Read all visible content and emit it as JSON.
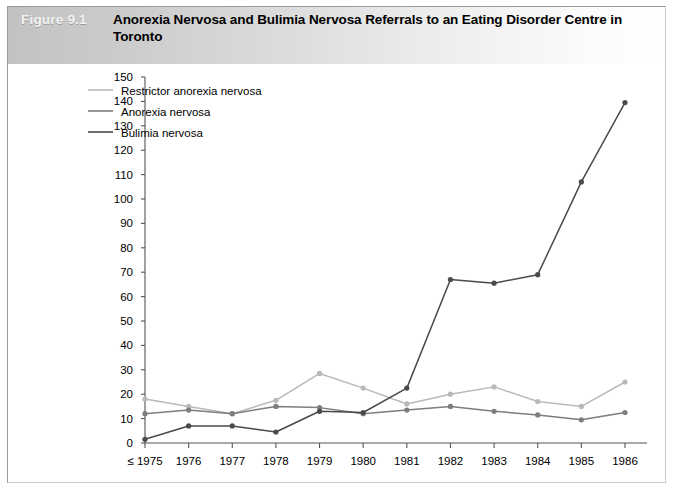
{
  "figure": {
    "number": "Figure 9.1",
    "title": "Anorexia Nervosa and Bulimia Nervosa Referrals to an Eating Disorder Centre in Toronto"
  },
  "colors": {
    "series_light": "#b9b9b9",
    "series_medium": "#7d7d7d",
    "series_dark": "#4a4a4a",
    "axis": "#555555",
    "header_band_left": "#c2c2c2",
    "header_band_right": "#ffffff",
    "frame_border": "#9a9a9a",
    "figure_number_text": "#f2f2f2"
  },
  "chart_data": {
    "type": "line",
    "title": "Anorexia Nervosa and Bulimia Nervosa Referrals to an Eating Disorder Centre in Toronto",
    "xlabel": "",
    "ylabel": "",
    "categories": [
      "≤ 1975",
      "1976",
      "1977",
      "1978",
      "1979",
      "1980",
      "1981",
      "1982",
      "1983",
      "1984",
      "1985",
      "1986"
    ],
    "ylim": [
      0,
      150
    ],
    "ytick_step": 10,
    "yticks": [
      0,
      10,
      20,
      30,
      40,
      50,
      60,
      70,
      80,
      90,
      100,
      110,
      120,
      130,
      140,
      150
    ],
    "ytick_labels": [
      "0",
      "10",
      "20",
      "30",
      "40",
      "50",
      "60",
      "70",
      "80",
      "90",
      "100",
      "110",
      "120",
      "130",
      "140",
      "150"
    ],
    "grid": false,
    "legend_position": "top-left-inside",
    "markers": true,
    "series": [
      {
        "name": "Restrictor anorexia nervosa",
        "color": "#b9b9b9",
        "values": [
          18,
          15,
          12,
          17.5,
          28.5,
          22.5,
          16,
          20,
          23,
          17,
          15,
          25
        ]
      },
      {
        "name": "Anorexia nervosa",
        "color": "#7d7d7d",
        "values": [
          12,
          13.5,
          12,
          15,
          14.5,
          12,
          13.5,
          15,
          13,
          11.5,
          9.5,
          12.5
        ]
      },
      {
        "name": "Bulimia nervosa",
        "color": "#4a4a4a",
        "values": [
          1.5,
          7,
          7,
          4.5,
          13,
          12.5,
          22.5,
          67,
          65.5,
          69,
          107,
          139.5
        ]
      }
    ]
  }
}
